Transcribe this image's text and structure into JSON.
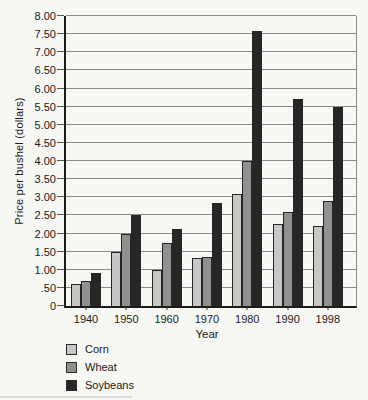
{
  "chart_data": {
    "type": "bar",
    "title": "",
    "xlabel": "Year",
    "ylabel": "Price per bushel (dollars)",
    "categories": [
      "1940",
      "1950",
      "1960",
      "1970",
      "1980",
      "1990",
      "1998"
    ],
    "series": [
      {
        "name": "Corn",
        "color": "#c6c8c5",
        "values": [
          0.62,
          1.5,
          1.0,
          1.33,
          3.1,
          2.25,
          2.2
        ]
      },
      {
        "name": "Wheat",
        "color": "#8f918e",
        "values": [
          0.68,
          2.0,
          1.75,
          1.36,
          4.0,
          2.6,
          2.9
        ]
      },
      {
        "name": "Soybeans",
        "color": "#262626",
        "values": [
          0.9,
          2.5,
          2.13,
          2.85,
          7.6,
          5.72,
          5.5
        ]
      }
    ],
    "ylim": [
      0,
      8
    ],
    "y_ticks": [
      "8.00",
      "7.50",
      "7.00",
      "6.50",
      "6.00",
      "5.50",
      "5.00",
      "4.50",
      "4.00",
      "3.50",
      "3.00",
      "2.50",
      "2.00",
      "1.50",
      "1.00",
      ".50",
      "0"
    ],
    "grid": "horizontal",
    "gridline_color": "#8a8a8a",
    "axis_color": "#1c1c1c",
    "bar_border_color": "#262626",
    "legend_position": "bottom-left"
  }
}
